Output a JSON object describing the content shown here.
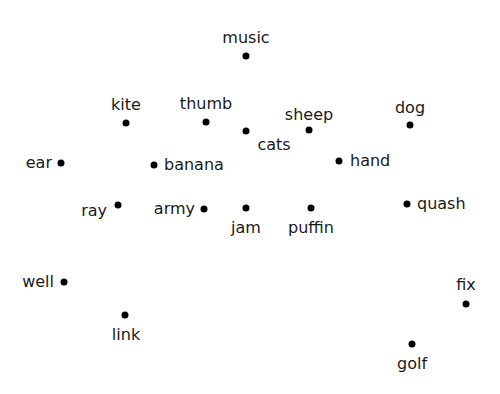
{
  "diagram": {
    "type": "word-scatter",
    "dot_color": "#000000",
    "text_color": "#1a1a1a",
    "points": [
      {
        "word": "music",
        "x": 246,
        "y": 56,
        "label_pos": "above",
        "lx": 246,
        "ly": 46
      },
      {
        "word": "kite",
        "x": 126,
        "y": 123,
        "label_pos": "above",
        "lx": 126,
        "ly": 113
      },
      {
        "word": "thumb",
        "x": 206,
        "y": 122,
        "label_pos": "above",
        "lx": 206,
        "ly": 112
      },
      {
        "word": "cats",
        "x": 246,
        "y": 131,
        "label_pos": "below",
        "lx": 274,
        "ly": 137
      },
      {
        "word": "sheep",
        "x": 309,
        "y": 130,
        "label_pos": "above",
        "lx": 309,
        "ly": 123
      },
      {
        "word": "dog",
        "x": 410,
        "y": 125,
        "label_pos": "above",
        "lx": 410,
        "ly": 116
      },
      {
        "word": "ear",
        "x": 61,
        "y": 163,
        "label_pos": "left",
        "lx": 52,
        "ly": 163
      },
      {
        "word": "banana",
        "x": 154,
        "y": 165,
        "label_pos": "right",
        "lx": 164,
        "ly": 165
      },
      {
        "word": "hand",
        "x": 339,
        "y": 161,
        "label_pos": "right",
        "lx": 350,
        "ly": 161
      },
      {
        "word": "ray",
        "x": 118,
        "y": 205,
        "label_pos": "left",
        "lx": 107,
        "ly": 211
      },
      {
        "word": "army",
        "x": 204,
        "y": 209,
        "label_pos": "left",
        "lx": 195,
        "ly": 209
      },
      {
        "word": "jam",
        "x": 246,
        "y": 208,
        "label_pos": "below",
        "lx": 246,
        "ly": 220
      },
      {
        "word": "puffin",
        "x": 311,
        "y": 208,
        "label_pos": "below",
        "lx": 311,
        "ly": 220
      },
      {
        "word": "quash",
        "x": 407,
        "y": 204,
        "label_pos": "right",
        "lx": 417,
        "ly": 204
      },
      {
        "word": "well",
        "x": 64,
        "y": 282,
        "label_pos": "left",
        "lx": 54,
        "ly": 282
      },
      {
        "word": "link",
        "x": 125,
        "y": 315,
        "label_pos": "below",
        "lx": 126,
        "ly": 327
      },
      {
        "word": "fix",
        "x": 466,
        "y": 304,
        "label_pos": "above",
        "lx": 466,
        "ly": 293
      },
      {
        "word": "golf",
        "x": 412,
        "y": 344,
        "label_pos": "below",
        "lx": 412,
        "ly": 356
      }
    ]
  }
}
